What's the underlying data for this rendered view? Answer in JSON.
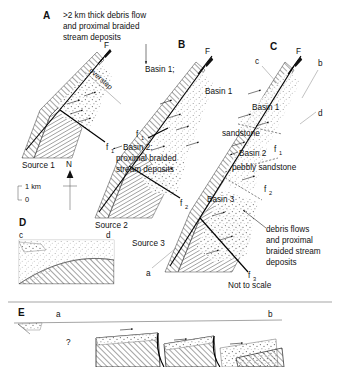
{
  "figure": {
    "caption_note": "Not to scale",
    "scale_bar": {
      "top": "1 km",
      "bottom": "0"
    },
    "north_arrow": "N"
  },
  "panels": [
    {
      "letter": "A",
      "annotation": ">2 km thick debris flow and proximal braided stream deposits",
      "annotation_lines": [
        ">2 km thick debris flow",
        "and proximal braided",
        "stream deposits"
      ],
      "labels": {
        "basin": "Basin 1;",
        "source": "Source 1",
        "master_fault": "F",
        "splay_fault": "f",
        "splay_fault_sub": "1",
        "overstep": "overstep"
      }
    },
    {
      "letter": "B",
      "labels": {
        "master_fault": "F",
        "basin_1": "Basin 1",
        "basin_2_line1": "Basin 2;",
        "basin_2_line2": "proximal braided",
        "basin_2_line3": "stream deposits",
        "source": "Source 2",
        "fault_1": "f",
        "fault_1_sub": "1",
        "fault_2": "f",
        "fault_2_sub": "2"
      }
    },
    {
      "letter": "C",
      "labels": {
        "master_fault": "F",
        "section_c": "c",
        "section_b": "b",
        "section_d": "d",
        "section_a": "a",
        "basin_1": "Basin 1",
        "basin_2": "Basin 2",
        "basin_3": "Basin 3",
        "sandstone": "sandstone",
        "pebbly_sandstone": "pebbly sandstone",
        "source": "Source 3",
        "fault_1": "f",
        "fault_1_sub": "1",
        "fault_2": "f",
        "fault_2_sub": "2",
        "fault_3": "f",
        "fault_3_sub": "3",
        "debris_lines": [
          "debris flows",
          "and proximal",
          "braided stream",
          "deposits"
        ],
        "not_to_scale": "Not to scale"
      }
    },
    {
      "letter": "D",
      "labels": {
        "left_end": "c",
        "right_end": "d"
      }
    },
    {
      "letter": "E",
      "labels": {
        "left_end": "a",
        "right_end": "b",
        "query": "?"
      }
    }
  ],
  "colors": {
    "ink": "#111111",
    "hatch": "#555555",
    "stipple": "#666666",
    "background": "#ffffff",
    "leader": "#333333"
  }
}
